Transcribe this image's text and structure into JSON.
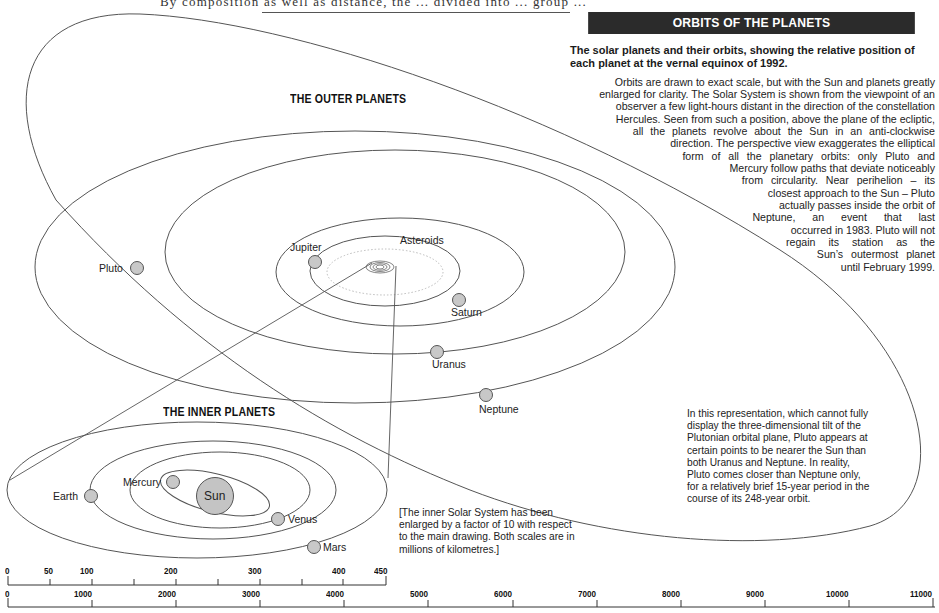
{
  "page": {
    "top_fragment": "By composition as well as distance, the ... divided into ... group ..."
  },
  "header": {
    "title": "ORBITS OF THE PLANETS",
    "lead": "The solar planets and their orbits, showing the relative position of each planet at the vernal equinox of 1992."
  },
  "body_lines": [
    "Orbits are drawn to exact scale, but with the Sun and planets greatly",
    "enlarged for clarity. The Solar System is shown from the viewpoint of an",
    "observer a few light-hours distant in the direction of the constellation",
    "Hercules. Seen from such a position, above the plane of the ecliptic,",
    "all the planets revolve about the Sun in an anti-clockwise",
    "direction. The perspective view exaggerates the elliptical",
    "form of all the planetary orbits: only Pluto and",
    "Mercury follow paths that deviate noticeably",
    "from circularity. Near perihelion – its",
    "closest approach to the Sun – Pluto",
    "actually passes inside the orbit of",
    "Neptune, an event that last",
    "occurred in 1983. Pluto will not",
    "regain its station as the",
    "Sun’s outermost planet",
    "until February 1999."
  ],
  "sections": {
    "outer_title": "THE OUTER PLANETS",
    "inner_title": "THE INNER PLANETS"
  },
  "outer_planets": [
    {
      "name": "Jupiter",
      "label": "Jupiter"
    },
    {
      "name": "Asteroids",
      "label": "Asteroids"
    },
    {
      "name": "Saturn",
      "label": "Saturn"
    },
    {
      "name": "Uranus",
      "label": "Uranus"
    },
    {
      "name": "Neptune",
      "label": "Neptune"
    },
    {
      "name": "Pluto",
      "label": "Pluto"
    }
  ],
  "inner_planets": [
    {
      "name": "Sun",
      "label": "Sun"
    },
    {
      "name": "Mercury",
      "label": "Mercury"
    },
    {
      "name": "Venus",
      "label": "Venus"
    },
    {
      "name": "Earth",
      "label": "Earth"
    },
    {
      "name": "Mars",
      "label": "Mars"
    }
  ],
  "notes": {
    "pluto_note": [
      "In this representation, which cannot fully",
      "display the three-dimensional tilt of the",
      "Plutonian orbital plane, Pluto appears at",
      "certain points to be nearer the Sun than",
      "both Uranus and Neptune. In reality,",
      "Pluto comes closer than Neptune only,",
      "for a relatively brief 15-year period in the",
      "course of its 248-year orbit."
    ],
    "scale_note": [
      "[The inner Solar System has been",
      "enlarged by a factor of 10 with respect",
      "to the main drawing. Both scales are in",
      "millions of kilometres.]"
    ]
  },
  "scales": {
    "inner": {
      "unit": "millions of kilometres",
      "ticks": [
        "0",
        "50",
        "100",
        "200",
        "300",
        "400",
        "450"
      ]
    },
    "outer": {
      "unit": "millions of kilometres",
      "ticks": [
        "0",
        "1000",
        "2000",
        "3000",
        "4000",
        "5000",
        "6000",
        "7000",
        "8000",
        "9000",
        "10000",
        "11000"
      ]
    }
  },
  "colors": {
    "title_bar_bg": "#2b2b2b",
    "title_bar_text": "#ffffff",
    "orbit_line": "#555555",
    "planet_fill": "#c8c8c8",
    "sun_fill": "#c4c4c4"
  }
}
